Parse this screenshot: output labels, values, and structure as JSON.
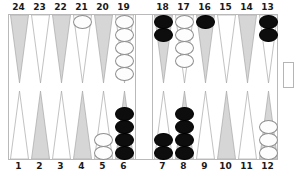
{
  "figure": {
    "type": "backgammon-board-diagram",
    "title_caption_partial": "",
    "colors": {
      "point_shaded": "#d6d6d6",
      "point_plain": "#ffffff",
      "point_outline": "#a8a8a8",
      "board_border": "#b9b9b9",
      "checker_white_fill": "#fdfdfd",
      "checker_white_border": "#8f8f8f",
      "checker_black_fill": "#0d0d0d",
      "label_color": "#1a1a1a"
    }
  },
  "labels": {
    "top_left": [
      "24",
      "23",
      "22",
      "21",
      "20",
      "19"
    ],
    "top_right": [
      "18",
      "17",
      "16",
      "15",
      "14",
      "13"
    ],
    "bottom_left": [
      "1",
      "2",
      "3",
      "4",
      "5",
      "6"
    ],
    "bottom_right": [
      "7",
      "8",
      "9",
      "10",
      "11",
      "12"
    ]
  },
  "points": {
    "top_left": [
      {
        "num": "24",
        "shade": "shaded",
        "checkers": 0,
        "color": "none"
      },
      {
        "num": "23",
        "shade": "plain",
        "checkers": 0,
        "color": "none"
      },
      {
        "num": "22",
        "shade": "shaded",
        "checkers": 0,
        "color": "none"
      },
      {
        "num": "21",
        "shade": "plain",
        "checkers": 1,
        "color": "white"
      },
      {
        "num": "20",
        "shade": "shaded",
        "checkers": 0,
        "color": "none"
      },
      {
        "num": "19",
        "shade": "plain",
        "checkers": 5,
        "color": "white"
      }
    ],
    "top_right": [
      {
        "num": "18",
        "shade": "shaded",
        "checkers": 2,
        "color": "black"
      },
      {
        "num": "17",
        "shade": "plain",
        "checkers": 4,
        "color": "white"
      },
      {
        "num": "16",
        "shade": "shaded",
        "checkers": 1,
        "color": "black"
      },
      {
        "num": "15",
        "shade": "plain",
        "checkers": 0,
        "color": "none"
      },
      {
        "num": "14",
        "shade": "shaded",
        "checkers": 0,
        "color": "none"
      },
      {
        "num": "13",
        "shade": "plain",
        "checkers": 2,
        "color": "black"
      }
    ],
    "bottom_left": [
      {
        "num": "1",
        "shade": "plain",
        "checkers": 0,
        "color": "none"
      },
      {
        "num": "2",
        "shade": "shaded",
        "checkers": 0,
        "color": "none"
      },
      {
        "num": "3",
        "shade": "plain",
        "checkers": 0,
        "color": "none"
      },
      {
        "num": "4",
        "shade": "shaded",
        "checkers": 0,
        "color": "none"
      },
      {
        "num": "5",
        "shade": "plain",
        "checkers": 2,
        "color": "white"
      },
      {
        "num": "6",
        "shade": "shaded",
        "checkers": 4,
        "color": "black"
      }
    ],
    "bottom_right": [
      {
        "num": "7",
        "shade": "plain",
        "checkers": 2,
        "color": "black"
      },
      {
        "num": "8",
        "shade": "shaded",
        "checkers": 4,
        "color": "black"
      },
      {
        "num": "9",
        "shade": "plain",
        "checkers": 0,
        "color": "none"
      },
      {
        "num": "10",
        "shade": "shaded",
        "checkers": 0,
        "color": "none"
      },
      {
        "num": "11",
        "shade": "plain",
        "checkers": 0,
        "color": "none"
      },
      {
        "num": "12",
        "shade": "shaded",
        "checkers": 3,
        "color": "white"
      }
    ]
  },
  "bar": {
    "white_on_bar": 0,
    "black_on_bar": 0
  },
  "bearoff_tray": {
    "label": "",
    "checkers": 0
  }
}
